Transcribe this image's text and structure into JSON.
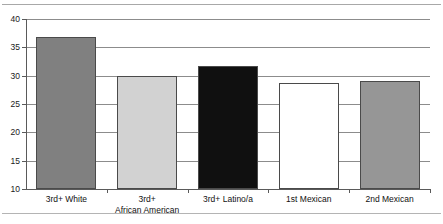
{
  "figure": {
    "top_rule": "divider-top",
    "bottom_rule": "divider-bottom",
    "title_remnant": "clipped title text"
  },
  "chart_data": {
    "type": "bar",
    "title": "",
    "subtitle": "",
    "xlabel": "",
    "ylabel": "",
    "categories": [
      "3rd+ White",
      "3rd+\nAfrican American",
      "3rd+ Latino/a",
      "1st Mexican",
      "2nd Mexican"
    ],
    "values": [
      36.8,
      30.0,
      31.7,
      28.7,
      29.1
    ],
    "bar_colors": [
      "#808080",
      "#d2d2d2",
      "#101010",
      "#ffffff",
      "#969696"
    ],
    "bar_border_color": "#4a4a4a",
    "ylim": [
      10,
      40
    ],
    "yticks": [
      10,
      15,
      20,
      25,
      30,
      35,
      40
    ],
    "ytick_labels": [
      "10",
      "15",
      "20",
      "25",
      "30",
      "35",
      "40"
    ],
    "grid": true,
    "grid_axis": "y",
    "legend": "none",
    "legend_position": "none"
  }
}
